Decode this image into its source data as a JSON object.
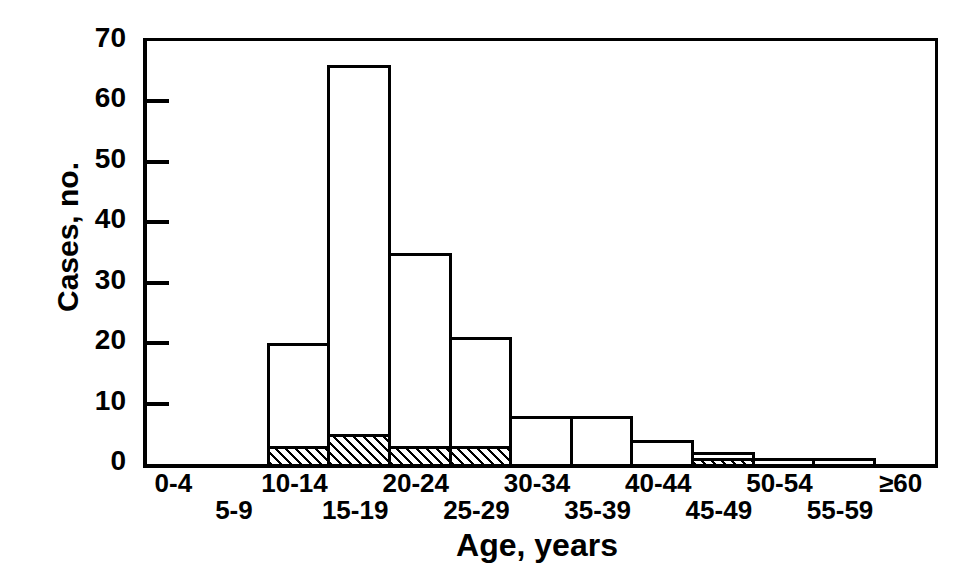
{
  "chart_data": {
    "type": "bar",
    "title": "",
    "subtitle": "",
    "xlabel": "Age, years",
    "ylabel": "Cases, no.",
    "categories": [
      "0-4",
      "5-9",
      "10-14",
      "15-19",
      "20-24",
      "25-29",
      "30-34",
      "35-39",
      "40-44",
      "45-49",
      "50-54",
      "55-59",
      "≥60"
    ],
    "values": [
      0,
      0,
      20,
      66,
      35,
      21,
      8,
      8,
      4,
      2,
      1,
      1,
      0
    ],
    "series": [
      {
        "name": "total",
        "fill": "open",
        "values": [
          0,
          0,
          20,
          66,
          35,
          21,
          8,
          8,
          4,
          2,
          1,
          1,
          0
        ]
      },
      {
        "name": "hatched-subset",
        "fill": "diagonal-hatch",
        "values": [
          0,
          0,
          3,
          5,
          3,
          3,
          0,
          0,
          0,
          1,
          0,
          0,
          0
        ]
      }
    ],
    "ylim": [
      0,
      70
    ],
    "yticks": [
      0,
      10,
      20,
      30,
      40,
      50,
      60,
      70
    ],
    "ytick_labels": [
      "0",
      "10",
      "20",
      "30",
      "40",
      "50",
      "60",
      "70"
    ],
    "xtick_label_rows": [
      0,
      1,
      0,
      1,
      0,
      1,
      0,
      1,
      0,
      1,
      0,
      1,
      0
    ],
    "grid": false,
    "legend": "none",
    "bar_style": "histogram-contiguous",
    "colors": {
      "line": "#000000",
      "background": "#ffffff",
      "hatch": "#000000"
    }
  }
}
